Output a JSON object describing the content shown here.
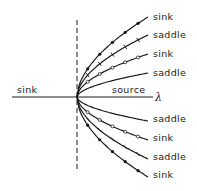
{
  "diagram": {
    "axis_label": "λ",
    "left_region_label": "sink",
    "right_region_label": "source",
    "branches_upper": [
      {
        "label": "sink",
        "marker": "filled-dot"
      },
      {
        "label": "saddle",
        "marker": "tick"
      },
      {
        "label": "sink",
        "marker": "open-arrow"
      },
      {
        "label": "saddle",
        "marker": "none"
      }
    ],
    "branches_lower": [
      {
        "label": "saddle",
        "marker": "none"
      },
      {
        "label": "sink",
        "marker": "open-arrow"
      },
      {
        "label": "saddle",
        "marker": "tick"
      },
      {
        "label": "sink",
        "marker": "filled-dot"
      }
    ]
  }
}
